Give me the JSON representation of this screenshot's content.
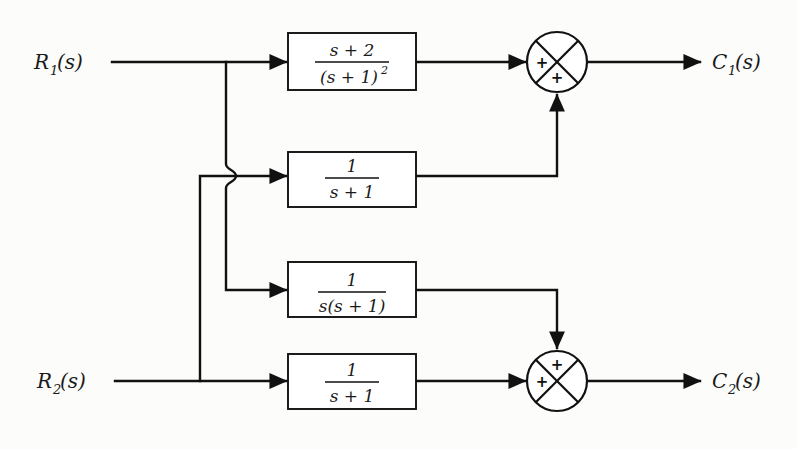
{
  "diagram": {
    "type": "block-diagram",
    "background_color": "#fcfcfa",
    "line_color": "#111111",
    "inputs": [
      {
        "id": "r1",
        "label": "R",
        "subscript": "1",
        "suffix": "(s)",
        "y": 62
      },
      {
        "id": "r2",
        "label": "R",
        "subscript": "2",
        "suffix": "(s)",
        "y": 381
      }
    ],
    "outputs": [
      {
        "id": "c1",
        "label": "C",
        "subscript": "1",
        "suffix": "(s)",
        "y": 62
      },
      {
        "id": "c2",
        "label": "C",
        "subscript": "2",
        "suffix": "(s)",
        "y": 381
      }
    ],
    "blocks": [
      {
        "id": "g11",
        "numerator": "s + 2",
        "denominator": "(s + 1)",
        "denominator_exponent": "2",
        "x": 288,
        "y": 33,
        "w": 128,
        "h": 57,
        "source": "R1",
        "target": "sum1"
      },
      {
        "id": "g12",
        "numerator": "1",
        "denominator": "s + 1",
        "denominator_exponent": "",
        "x": 288,
        "y": 152,
        "w": 128,
        "h": 55,
        "source": "R2",
        "target": "sum1"
      },
      {
        "id": "g21",
        "numerator": "1",
        "denominator": "s(s + 1)",
        "denominator_exponent": "",
        "x": 288,
        "y": 262,
        "w": 128,
        "h": 55,
        "source": "R1",
        "target": "sum2"
      },
      {
        "id": "g22",
        "numerator": "1",
        "denominator": "s + 1",
        "denominator_exponent": "",
        "x": 288,
        "y": 354,
        "w": 128,
        "h": 55,
        "source": "R2",
        "target": "sum2"
      }
    ],
    "summers": [
      {
        "id": "sum1",
        "cx": 557,
        "cy": 62,
        "r": 30,
        "signs": {
          "left": "+",
          "bottom": "+"
        },
        "output": "C1(s)"
      },
      {
        "id": "sum2",
        "cx": 557,
        "cy": 381,
        "r": 30,
        "signs": {
          "left": "+",
          "top": "+"
        },
        "output": "C2(s)"
      }
    ],
    "junctions": [
      {
        "id": "r1-branch",
        "x": 226,
        "y": 62,
        "note": "R1 splits to G11 and down to G21"
      },
      {
        "id": "r2-branch",
        "x": 200,
        "y": 381,
        "note": "R2 splits to G22 and up to G12"
      },
      {
        "id": "wire-hop",
        "x": 226,
        "y": 175,
        "note": "R2 riser hops over R1 vertical drop"
      }
    ]
  }
}
